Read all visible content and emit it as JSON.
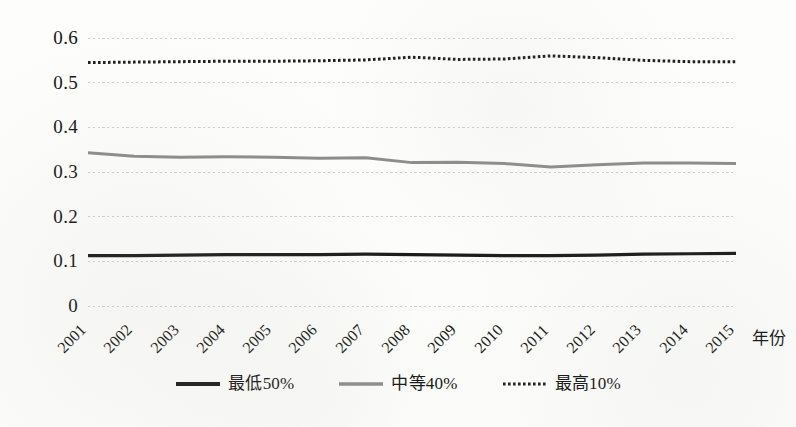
{
  "chart_data": {
    "type": "line",
    "title": "",
    "xlabel": "年份",
    "ylabel": "",
    "x": [
      2001,
      2002,
      2003,
      2004,
      2005,
      2006,
      2007,
      2008,
      2009,
      2010,
      2011,
      2012,
      2013,
      2014,
      2015
    ],
    "categories": [
      "2001",
      "2002",
      "2003",
      "2004",
      "2005",
      "2006",
      "2007",
      "2008",
      "2009",
      "2010",
      "2011",
      "2012",
      "2013",
      "2014",
      "2015"
    ],
    "ylim": [
      0,
      0.6
    ],
    "xlim": [
      2001,
      2015
    ],
    "y_ticks": [
      "0",
      "0.1",
      "0.2",
      "0.3",
      "0.4",
      "0.5",
      "0.6"
    ],
    "y_tick_values": [
      0,
      0.1,
      0.2,
      0.3,
      0.4,
      0.5,
      0.6
    ],
    "grid": true,
    "grid_style": "dotted-horizontal",
    "legend_position": "bottom-center",
    "series": [
      {
        "name": "最低50%",
        "style": "solid",
        "color": "#1a1a1a",
        "width": 3.2,
        "values": [
          0.113,
          0.113,
          0.114,
          0.115,
          0.115,
          0.115,
          0.116,
          0.115,
          0.114,
          0.113,
          0.113,
          0.114,
          0.116,
          0.117,
          0.118
        ]
      },
      {
        "name": "中等40%",
        "style": "solid",
        "color": "#8c8c8c",
        "width": 3.0,
        "values": [
          0.343,
          0.335,
          0.333,
          0.334,
          0.333,
          0.331,
          0.332,
          0.321,
          0.322,
          0.319,
          0.311,
          0.316,
          0.32,
          0.32,
          0.319
        ]
      },
      {
        "name": "最高10%",
        "style": "dotted",
        "color": "#1f1f1f",
        "width": 3.0,
        "values": [
          0.545,
          0.546,
          0.547,
          0.548,
          0.548,
          0.549,
          0.551,
          0.557,
          0.552,
          0.553,
          0.56,
          0.556,
          0.55,
          0.547,
          0.547
        ]
      }
    ]
  },
  "axis": {
    "x_title": "年份"
  },
  "legend": {
    "items": [
      {
        "label": "最低50%",
        "swatch": "solid-black-thick"
      },
      {
        "label": "中等40%",
        "swatch": "solid-gray"
      },
      {
        "label": "最高10%",
        "swatch": "dotted-black"
      }
    ]
  }
}
